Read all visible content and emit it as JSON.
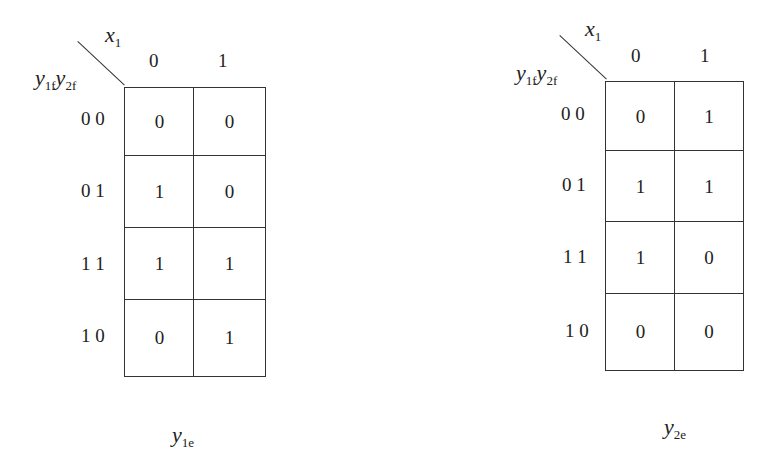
{
  "maps": [
    {
      "id": "y1e",
      "column_var": {
        "base": "x",
        "sub": "1"
      },
      "row_vars": [
        {
          "base": "y",
          "sub": "1f"
        },
        {
          "base": "y",
          "sub": "2f"
        }
      ],
      "column_labels": [
        "0",
        "1"
      ],
      "row_labels": [
        "0 0",
        "0 1",
        "1 1",
        "1 0"
      ],
      "cells": [
        [
          "0",
          "0"
        ],
        [
          "1",
          "0"
        ],
        [
          "1",
          "1"
        ],
        [
          "0",
          "1"
        ]
      ],
      "caption": {
        "base": "y",
        "sub": "1e"
      }
    },
    {
      "id": "y2e",
      "column_var": {
        "base": "x",
        "sub": "1"
      },
      "row_vars": [
        {
          "base": "y",
          "sub": "1f"
        },
        {
          "base": "y",
          "sub": "2f"
        }
      ],
      "column_labels": [
        "0",
        "1"
      ],
      "row_labels": [
        "0 0",
        "0 1",
        "1 1",
        "1 0"
      ],
      "cells": [
        [
          "0",
          "1"
        ],
        [
          "1",
          "1"
        ],
        [
          "1",
          "0"
        ],
        [
          "0",
          "0"
        ]
      ],
      "caption": {
        "base": "y",
        "sub": "2e"
      }
    }
  ]
}
